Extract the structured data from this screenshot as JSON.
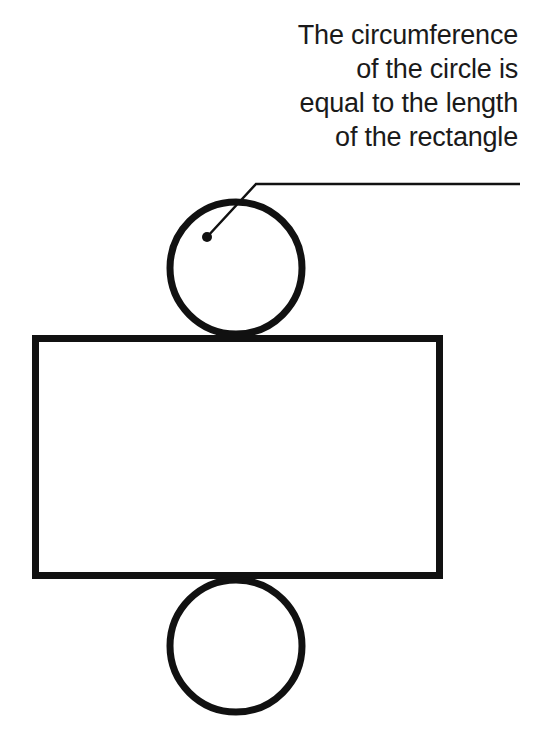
{
  "diagram": {
    "annotation": {
      "lines": [
        "The circumference",
        "of the circle is",
        "equal to the length",
        "of the rectangle"
      ],
      "leader": {
        "dot": [
          207,
          237
        ],
        "bend": [
          256,
          184
        ],
        "end": [
          520,
          184
        ]
      }
    },
    "shapes": {
      "top_circle": {
        "cx": 236,
        "cy": 268,
        "r": 66
      },
      "rectangle": {
        "x": 35.5,
        "y": 338.5,
        "width": 404,
        "height": 237
      },
      "bottom_circle": {
        "cx": 236,
        "cy": 646,
        "r": 66
      }
    },
    "colors": {
      "stroke": "#111111",
      "background": "#ffffff",
      "text": "#1a1a1a"
    }
  }
}
